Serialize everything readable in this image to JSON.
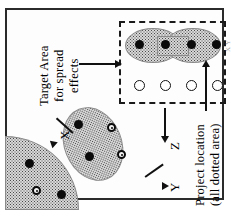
{
  "figure": {
    "orientation": "rotated-90-ccw",
    "labels": {
      "target_area": {
        "line1": "Target Area",
        "line2": "for spread",
        "line3": "effects"
      },
      "project_location": {
        "line1": "Project location",
        "line2": "(all dotted area)"
      },
      "x": "X",
      "y": "Y",
      "z": "Z",
      "margin_note": "X Y"
    },
    "colors": {
      "stipple_fill": "#d8d8d8",
      "stipple_dot": "#4a4a4a",
      "marker_filled": "#0b0b0b",
      "marker_open": "#ffffff",
      "frame": "#2b2b2b",
      "dashed_box": "#1a1a1a"
    },
    "regions": [
      {
        "name": "target-area-peanut",
        "shape": "peanut",
        "inside_dashed_box": true,
        "filled_markers": 4,
        "ring_markers": 0
      },
      {
        "name": "project-ellipse",
        "shape": "ellipse",
        "inside_dashed_box": false,
        "filled_markers": 2,
        "ring_markers": 2
      },
      {
        "name": "project-quarter-circle",
        "shape": "quarter-circle",
        "inside_dashed_box": false,
        "filled_markers": 2,
        "ring_markers": 1
      }
    ],
    "open_circles_row": {
      "count": 4,
      "inside_dashed_box": true
    },
    "arrows": [
      {
        "name": "target-area-arrow",
        "direction": "right",
        "from": "target-area-label",
        "to": "dashed-box"
      },
      {
        "name": "project-location-arrow",
        "direction": "up",
        "from": "project-location-label",
        "to": "dashed-box"
      },
      {
        "name": "z-arrow",
        "direction": "down",
        "label": "Z"
      },
      {
        "name": "x-arrow",
        "direction": "down-left",
        "label": "X"
      },
      {
        "name": "y-arrow",
        "direction": "up-left",
        "label": "Y"
      }
    ]
  }
}
